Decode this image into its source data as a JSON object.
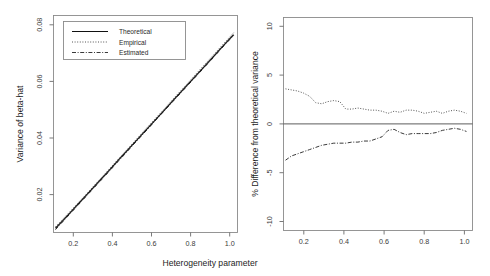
{
  "figure": {
    "panels": [
      {
        "id": "left",
        "ylabel": "Variance of beta-hat",
        "xlabel": "Heterogeneity parameter",
        "xticks": [
          "0.2",
          "0.4",
          "0.6",
          "0.8",
          "1.0"
        ],
        "yticks": [
          "0.02",
          "0.04",
          "0.06",
          "0.08"
        ],
        "legend": {
          "items": [
            {
              "label": "Theoretical",
              "style": "solid"
            },
            {
              "label": "Empirical",
              "style": "dotted"
            },
            {
              "label": "Estimated",
              "style": "dashdot"
            }
          ]
        }
      },
      {
        "id": "right",
        "ylabel": "% Difference from theoretical variance",
        "xlabel": "",
        "xticks": [
          "0.2",
          "0.4",
          "0.6",
          "0.8",
          "1.0"
        ],
        "yticks": [
          "10",
          "5",
          "0",
          "-5",
          "-10"
        ]
      }
    ]
  },
  "chart_data": [
    {
      "type": "line",
      "panel": "left",
      "title": "",
      "xlabel": "Heterogeneity parameter",
      "ylabel": "Variance of beta-hat",
      "xlim": [
        0.1,
        1.04
      ],
      "ylim": [
        0.0128,
        0.0895
      ],
      "xticks": [
        0.2,
        0.4,
        0.6,
        0.8,
        1.0
      ],
      "yticks": [
        0.02,
        0.04,
        0.06,
        0.08
      ],
      "grid": false,
      "legend_position": "top-left",
      "x": [
        0.11,
        0.15,
        0.19,
        0.23,
        0.27,
        0.31,
        0.35,
        0.39,
        0.43,
        0.47,
        0.51,
        0.55,
        0.59,
        0.63,
        0.67,
        0.71,
        0.75,
        0.79,
        0.83,
        0.87,
        0.91,
        0.95,
        0.99,
        1.02
      ],
      "series": [
        {
          "name": "Theoretical",
          "style": "solid",
          "values": [
            0.0143,
            0.0172,
            0.0202,
            0.0232,
            0.0262,
            0.0292,
            0.0322,
            0.0352,
            0.0383,
            0.0413,
            0.0443,
            0.0473,
            0.0503,
            0.0533,
            0.0563,
            0.0594,
            0.0624,
            0.0654,
            0.0684,
            0.0714,
            0.0744,
            0.0775,
            0.0805,
            0.0827
          ]
        },
        {
          "name": "Empirical",
          "style": "dotted",
          "values": [
            0.0148,
            0.0177,
            0.0206,
            0.0236,
            0.0265,
            0.0296,
            0.0326,
            0.0356,
            0.0387,
            0.0417,
            0.0447,
            0.0478,
            0.0508,
            0.0538,
            0.0568,
            0.0599,
            0.0629,
            0.0659,
            0.069,
            0.072,
            0.075,
            0.0781,
            0.0811,
            0.0834
          ]
        },
        {
          "name": "Estimated",
          "style": "dashdot",
          "values": [
            0.0138,
            0.0168,
            0.0198,
            0.0228,
            0.0258,
            0.0288,
            0.0318,
            0.0348,
            0.0379,
            0.0409,
            0.044,
            0.047,
            0.05,
            0.0531,
            0.0561,
            0.0591,
            0.0621,
            0.0651,
            0.0681,
            0.0711,
            0.0741,
            0.0772,
            0.0802,
            0.0824
          ]
        }
      ]
    },
    {
      "type": "line",
      "panel": "right",
      "title": "",
      "xlabel": "",
      "ylabel": "% Difference from theoretical variance",
      "xlim": [
        0.1,
        1.04
      ],
      "ylim": [
        -10,
        10
      ],
      "xticks": [
        0.2,
        0.4,
        0.6,
        0.8,
        1.0
      ],
      "yticks": [
        -10,
        -5,
        0,
        5,
        10
      ],
      "grid": false,
      "zero_reference_line": 0,
      "x": [
        0.11,
        0.14,
        0.17,
        0.2,
        0.23,
        0.26,
        0.29,
        0.32,
        0.35,
        0.38,
        0.41,
        0.44,
        0.47,
        0.5,
        0.53,
        0.56,
        0.59,
        0.62,
        0.65,
        0.68,
        0.71,
        0.74,
        0.77,
        0.8,
        0.83,
        0.86,
        0.89,
        0.92,
        0.95,
        0.98,
        1.01
      ],
      "series": [
        {
          "name": "Empirical",
          "style": "dotted",
          "values": [
            3.3,
            3.2,
            3.1,
            2.9,
            2.6,
            2.0,
            1.9,
            2.1,
            2.2,
            2.1,
            1.4,
            1.4,
            1.5,
            1.4,
            1.3,
            1.3,
            1.2,
            1.0,
            1.2,
            1.1,
            1.3,
            1.3,
            1.2,
            1.0,
            1.1,
            1.2,
            1.0,
            1.2,
            1.3,
            1.2,
            1.0
          ]
        },
        {
          "name": "Estimated",
          "style": "dashdot",
          "values": [
            -3.4,
            -3.0,
            -2.8,
            -2.6,
            -2.4,
            -2.2,
            -2.0,
            -1.9,
            -1.8,
            -1.8,
            -1.8,
            -1.7,
            -1.7,
            -1.6,
            -1.6,
            -1.4,
            -1.2,
            -0.6,
            -0.5,
            -0.8,
            -1.0,
            -0.9,
            -0.9,
            -0.9,
            -0.9,
            -0.8,
            -0.6,
            -0.5,
            -0.4,
            -0.5,
            -0.7
          ]
        }
      ]
    }
  ]
}
